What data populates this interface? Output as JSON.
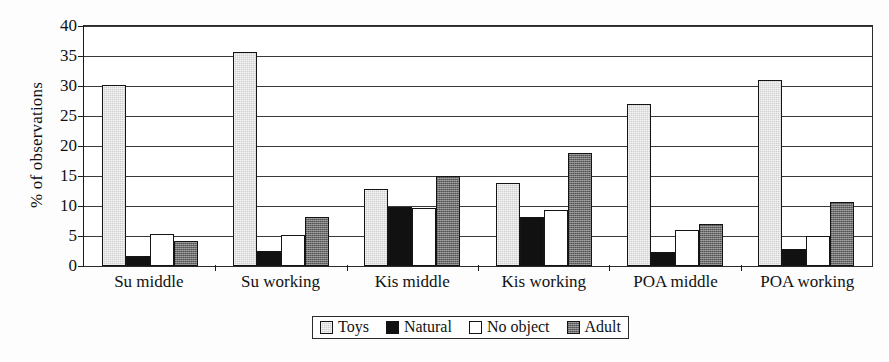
{
  "chart_data": {
    "type": "bar",
    "title": "",
    "xlabel": "",
    "ylabel": "% of observations",
    "ylim": [
      0,
      40
    ],
    "ytick_step": 5,
    "yticks": [
      0,
      5,
      10,
      15,
      20,
      25,
      30,
      35,
      40
    ],
    "grid": true,
    "legend_position": "bottom-center",
    "categories": [
      "Su middle",
      "Su working",
      "Kis middle",
      "Kis working",
      "POA middle",
      "POA working"
    ],
    "series": [
      {
        "name": "Toys",
        "color": "#cfcfcf",
        "values": [
          30.2,
          35.6,
          12.9,
          13.9,
          27.0,
          31.0
        ]
      },
      {
        "name": "Natural",
        "color": "#111111",
        "values": [
          1.6,
          2.5,
          9.8,
          8.1,
          2.3,
          2.9
        ]
      },
      {
        "name": "No object",
        "color": "#ffffff",
        "values": [
          5.3,
          5.1,
          9.7,
          9.3,
          6.0,
          5.0
        ]
      },
      {
        "name": "Adult",
        "color": "#6e6e6e",
        "values": [
          4.1,
          8.1,
          15.0,
          18.8,
          7.0,
          10.6
        ]
      }
    ]
  },
  "axis": {
    "y_title": "% of observations",
    "y_tick_labels": [
      "0",
      "5",
      "10",
      "15",
      "20",
      "25",
      "30",
      "35",
      "40"
    ]
  },
  "legend": {
    "entries": [
      {
        "label": "Toys"
      },
      {
        "label": "Natural"
      },
      {
        "label": "No object"
      },
      {
        "label": "Adult"
      }
    ]
  }
}
